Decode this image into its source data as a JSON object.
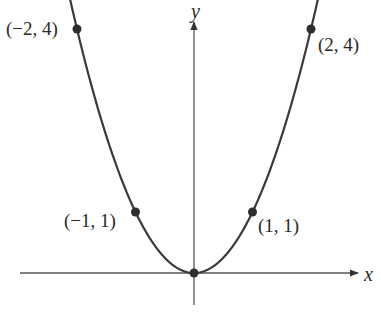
{
  "chart_data": {
    "type": "line",
    "title": "",
    "function": "y = x^2",
    "xlabel": "x",
    "ylabel": "y",
    "x": [
      -2,
      -1.5,
      -1,
      -0.5,
      0,
      0.5,
      1,
      1.5,
      2
    ],
    "series": [
      {
        "name": "y = x^2",
        "values": [
          4,
          2.25,
          1,
          0.25,
          0,
          0.25,
          1,
          2.25,
          4
        ]
      }
    ],
    "marked_points": [
      {
        "x": -2,
        "y": 4,
        "label": "(−2, 4)"
      },
      {
        "x": -1,
        "y": 1,
        "label": "(−1, 1)"
      },
      {
        "x": 0,
        "y": 0,
        "label": ""
      },
      {
        "x": 1,
        "y": 1,
        "label": "(1, 1)"
      },
      {
        "x": 2,
        "y": 4,
        "label": "(2, 4)"
      }
    ],
    "xlim": [
      -3,
      3
    ],
    "ylim": [
      -0.5,
      4.3
    ],
    "grid": false,
    "legend": "none"
  },
  "labels": {
    "x_axis": "x",
    "y_axis": "y",
    "p_neg2": "(−2, 4)",
    "p_pos2": "(2, 4)",
    "p_neg1": "(−1, 1)",
    "p_pos1": "(1, 1)"
  },
  "colors": {
    "curve": "#3a3a3a",
    "axis": "#555555",
    "point": "#2e2e2e"
  }
}
